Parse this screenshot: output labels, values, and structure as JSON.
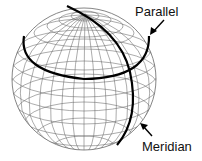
{
  "diagram": {
    "labels": {
      "parallel": "Parallel",
      "meridian": "Meridian"
    },
    "colors": {
      "grid": "#555555",
      "highlight": "#000000",
      "text": "#111111",
      "background": "#ffffff"
    }
  }
}
